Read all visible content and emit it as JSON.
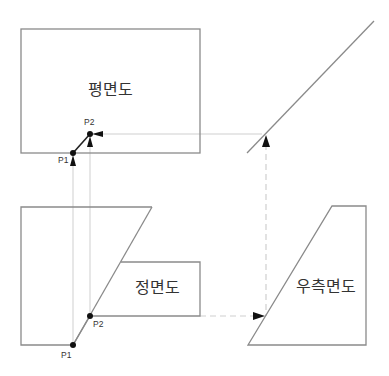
{
  "diagram": {
    "type": "orthographic-projection",
    "views": {
      "plan": {
        "label": "평면도"
      },
      "front": {
        "label": "정면도"
      },
      "right_side": {
        "label": "우측면도"
      }
    },
    "points": {
      "plan_p1": {
        "label": "P1"
      },
      "plan_p2": {
        "label": "P2"
      },
      "front_p1": {
        "label": "P1"
      },
      "front_p2": {
        "label": "P2"
      }
    },
    "colors": {
      "outline": "#8a8a8a",
      "projection_line": "#cfcfcf",
      "edge": "#222222",
      "point": "#111111",
      "text": "#333333"
    }
  }
}
